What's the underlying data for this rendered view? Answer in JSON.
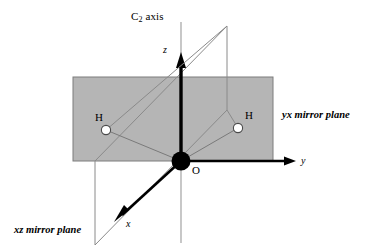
{
  "figure": {
    "title_label": "C",
    "c2_axis": {
      "base": "C",
      "sub": "2",
      "rest": " axis"
    },
    "axes": [
      {
        "name": "z-axis-label",
        "text": "z"
      },
      {
        "name": "y-axis-label",
        "text": "y"
      },
      {
        "name": "x-axis-label",
        "text": "x"
      }
    ],
    "atoms": [
      {
        "name": "oxygen-atom-label",
        "text": "O"
      },
      {
        "name": "hydrogen-atom-left-label",
        "text": "H"
      },
      {
        "name": "hydrogen-atom-right-label",
        "text": "H"
      }
    ],
    "planes": [
      {
        "name": "yx-mirror-plane-label",
        "text": "yx mirror plane"
      },
      {
        "name": "xz-mirror-plane-label",
        "text": "xz mirror plane"
      }
    ],
    "colors": {
      "plane_fill": "#b5b5b5",
      "plane_stroke": "#707070",
      "axis": "#000000",
      "thin_line": "#8a8a8a",
      "atom_fill": "#000000",
      "hydrogen_fill": "#ffffff",
      "background": "#ffffff"
    }
  }
}
